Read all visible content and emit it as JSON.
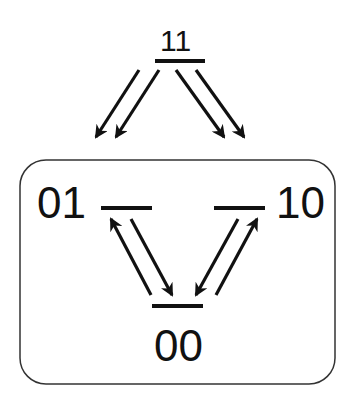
{
  "diagram": {
    "type": "state-transition diagram",
    "stroke_color": "#111111",
    "background_color": "#ffffff",
    "states": [
      {
        "id": "s11",
        "label": "11",
        "level_line": {
          "x1": 155,
          "x2": 205,
          "y": 61
        }
      },
      {
        "id": "s01",
        "label": "01",
        "level_line": {
          "x1": 101,
          "x2": 152,
          "y": 208
        }
      },
      {
        "id": "s10",
        "label": "10",
        "level_line": {
          "x1": 214,
          "x2": 265,
          "y": 208
        }
      },
      {
        "id": "s00",
        "label": "00",
        "level_line": {
          "x1": 152,
          "x2": 203,
          "y": 306
        }
      }
    ],
    "group_box": {
      "contains": [
        "01",
        "10",
        "00"
      ],
      "x": 20,
      "y": 160,
      "width": 315,
      "height": 224,
      "corner_radius": 26
    },
    "transitions": [
      {
        "from": "11",
        "to": "01",
        "x1": 139,
        "y1": 70,
        "x2": 96,
        "y2": 137
      },
      {
        "from": "11",
        "to": "01",
        "x1": 159,
        "y1": 70,
        "x2": 116,
        "y2": 137
      },
      {
        "from": "11",
        "to": "10",
        "x1": 176,
        "y1": 70,
        "x2": 224,
        "y2": 137
      },
      {
        "from": "11",
        "to": "10",
        "x1": 196,
        "y1": 70,
        "x2": 244,
        "y2": 137
      },
      {
        "from": "00",
        "to": "01",
        "x1": 151,
        "y1": 295,
        "x2": 111,
        "y2": 219
      },
      {
        "from": "01",
        "to": "00",
        "x1": 131,
        "y1": 219,
        "x2": 172,
        "y2": 295
      },
      {
        "from": "10",
        "to": "00",
        "x1": 238,
        "y1": 219,
        "x2": 196,
        "y2": 295
      },
      {
        "from": "00",
        "to": "10",
        "x1": 216,
        "y1": 295,
        "x2": 257,
        "y2": 219
      }
    ]
  }
}
